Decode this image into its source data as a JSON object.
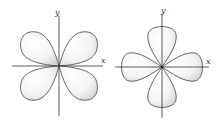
{
  "diagrams": [
    {
      "name": "d-orbital-dxy",
      "x_label": "x",
      "y_label": "y",
      "lobes": 4,
      "orientation": "between-axes"
    },
    {
      "name": "d-orbital-dx2-y2",
      "x_label": "x",
      "y_label": "y",
      "lobes": 4,
      "orientation": "along-axes"
    }
  ],
  "colors": {
    "lobe_fill_light": "#ffffff",
    "lobe_fill_shade": "#d8d8d8",
    "outline": "#555555",
    "axis": "#333333"
  }
}
